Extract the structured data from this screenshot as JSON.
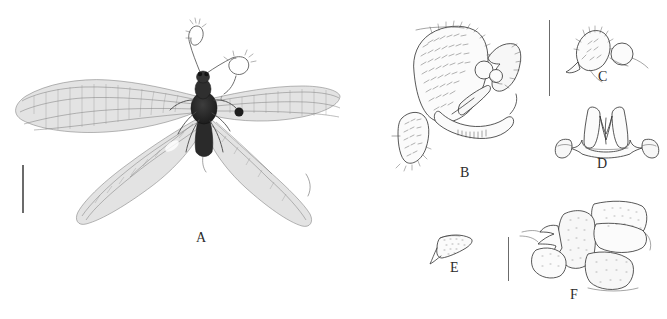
{
  "figure": {
    "background_color": "#ffffff",
    "line_color": "#3a3a3a",
    "label_color": "#2b2b2b",
    "scale_bar_color": "#6b6b6b",
    "width": 667,
    "height": 319,
    "panels": [
      {
        "id": "A",
        "label": "A",
        "label_x": 196,
        "label_y": 231,
        "kind": "photograph",
        "subject": "adult habitus, dorsal view, winged insect (Neuroptera)",
        "description": "pinned adult specimen with two pairs of long narrow membranous wings spread laterally, dark head and thorax, clubbed antennae"
      },
      {
        "id": "B",
        "label": "B",
        "label_x": 460,
        "label_y": 166,
        "kind": "line-drawing",
        "subject": "male terminalia, lateral view",
        "description": "large setose ectoproct lobe with dense hair stippling, gonarcus and mediuncus sclerites, rounded callus cerci"
      },
      {
        "id": "C",
        "label": "C",
        "label_x": 598,
        "label_y": 70,
        "kind": "line-drawing",
        "subject": "ectoproct with callus cerci, lateral view",
        "description": "small hairy lobe with circular callus cerci"
      },
      {
        "id": "D",
        "label": "D",
        "label_x": 597,
        "label_y": 157,
        "kind": "line-drawing",
        "subject": "gonarcus complex, posterior view",
        "description": "bilaterally symmetric arched sclerite with two median pointed processes and lateral rounded lobes"
      },
      {
        "id": "E",
        "label": "E",
        "label_x": 450,
        "label_y": 261,
        "kind": "line-drawing",
        "subject": "gonapophysis, lateral view",
        "description": "small triangular stippled sclerite with a curved basal process"
      },
      {
        "id": "F",
        "label": "F",
        "label_x": 570,
        "label_y": 291,
        "kind": "line-drawing",
        "subject": "terminal abdominal segments, lateral view",
        "description": "stippled abdominal apex showing tergite, sternite and ectoproct with hooked process"
      }
    ],
    "scale_bars": [
      {
        "id": "scale-bar-A",
        "x": 22,
        "y": 165,
        "length": 48,
        "orientation": "vertical",
        "thickness": 1.6
      },
      {
        "id": "scale-bar-BCD",
        "x": 549,
        "y": 20,
        "length": 76,
        "orientation": "vertical",
        "thickness": 1.4
      },
      {
        "id": "scale-bar-EF",
        "x": 508,
        "y": 237,
        "length": 44,
        "orientation": "vertical",
        "thickness": 1.4
      }
    ]
  }
}
